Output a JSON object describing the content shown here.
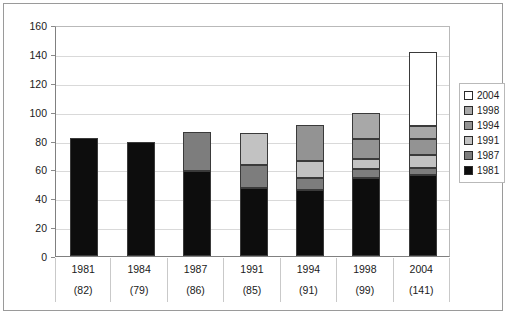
{
  "chart_data": {
    "type": "bar",
    "stacked": true,
    "title": "",
    "xlabel": "",
    "ylabel": "",
    "ylim": [
      0,
      160
    ],
    "ytick_step": 20,
    "yticks": [
      0,
      20,
      40,
      60,
      80,
      100,
      120,
      140,
      160
    ],
    "grid": true,
    "legend_position": "right",
    "categories": [
      "1981",
      "1984",
      "1987",
      "1991",
      "1994",
      "1998",
      "2004"
    ],
    "category_totals": [
      82,
      79,
      86,
      85,
      91,
      99,
      141
    ],
    "category_total_labels": [
      "(82)",
      "(79)",
      "(86)",
      "(85)",
      "(91)",
      "(99)",
      "(141)"
    ],
    "series": [
      {
        "name": "1981",
        "color": "#0d0d0d",
        "values": [
          82,
          79,
          59,
          47,
          46,
          54,
          56
        ]
      },
      {
        "name": "1987",
        "color": "#7d7d7d",
        "values": [
          0,
          0,
          27,
          16,
          8,
          6,
          5
        ]
      },
      {
        "name": "1991",
        "color": "#c2c2c2",
        "values": [
          0,
          0,
          0,
          22,
          12,
          7,
          9
        ]
      },
      {
        "name": "1994",
        "color": "#939393",
        "values": [
          0,
          0,
          0,
          0,
          25,
          14,
          11
        ]
      },
      {
        "name": "1998",
        "color": "#a8a8a8",
        "values": [
          0,
          0,
          0,
          0,
          0,
          18,
          9
        ]
      },
      {
        "name": "2004",
        "color": "#ffffff",
        "values": [
          0,
          0,
          0,
          0,
          0,
          0,
          51
        ]
      }
    ],
    "legend_entries": [
      {
        "label": "2004",
        "color": "#ffffff"
      },
      {
        "label": "1998",
        "color": "#a8a8a8"
      },
      {
        "label": "1994",
        "color": "#939393"
      },
      {
        "label": "1991",
        "color": "#c2c2c2"
      },
      {
        "label": "1987",
        "color": "#7d7d7d"
      },
      {
        "label": "1981",
        "color": "#0d0d0d"
      }
    ]
  }
}
